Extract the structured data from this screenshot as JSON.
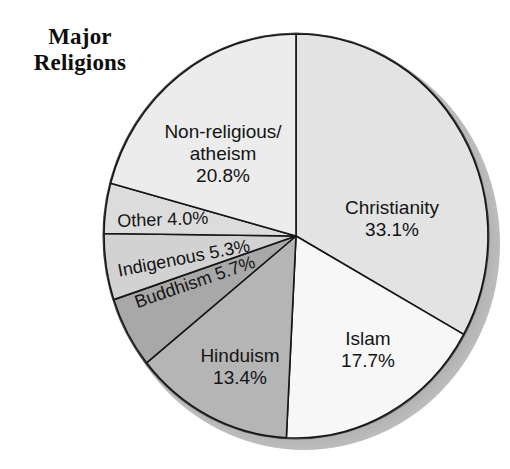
{
  "chart_title": "Major\nReligions",
  "chart_data": {
    "type": "pie",
    "title": "Major Religions",
    "unit": "percent",
    "start_angle_deg": 0,
    "direction": "clockwise",
    "legend": "none (labels drawn on slices)",
    "grid": false,
    "categories": [
      "Christianity",
      "Islam",
      "Hinduism",
      "Buddhism",
      "Indigenous",
      "Other",
      "Non-religious/atheism"
    ],
    "values": [
      33.1,
      17.7,
      13.4,
      5.7,
      5.3,
      4.0,
      20.8
    ],
    "slices": [
      {
        "name": "Christianity",
        "value": 33.1,
        "label": "Christianity\n33.1%",
        "color": "#e3e3e3",
        "start_deg": 0,
        "end_deg": 119.16
      },
      {
        "name": "Islam",
        "value": 17.7,
        "label": "Islam\n17.7%",
        "color": "#f7f7f7",
        "start_deg": 119.16,
        "end_deg": 182.88
      },
      {
        "name": "Hinduism",
        "value": 13.4,
        "label": "Hinduism\n13.4%",
        "color": "#b5b5b5",
        "start_deg": 182.88,
        "end_deg": 231.12
      },
      {
        "name": "Buddhism",
        "value": 5.7,
        "label": "Buddhism 5.7%",
        "color": "#a8a8a8",
        "start_deg": 231.12,
        "end_deg": 251.64
      },
      {
        "name": "Indigenous",
        "value": 5.3,
        "label": "Indigenous 5.3%",
        "color": "#d2d2d2",
        "start_deg": 251.64,
        "end_deg": 270.72
      },
      {
        "name": "Other",
        "value": 4.0,
        "label": "Other 4.0%",
        "color": "#dcdcdc",
        "start_deg": 270.72,
        "end_deg": 285.12
      },
      {
        "name": "Non-religious/atheism",
        "value": 20.8,
        "label": "Non-religious/\natheism\n20.8%",
        "color": "#ececec",
        "start_deg": 285.12,
        "end_deg": 360
      }
    ]
  },
  "style": {
    "outline_color": "#161616",
    "shadow_color": "#9a9a9a",
    "rim_color": "#c4c4c4",
    "text_color": "#141414"
  }
}
